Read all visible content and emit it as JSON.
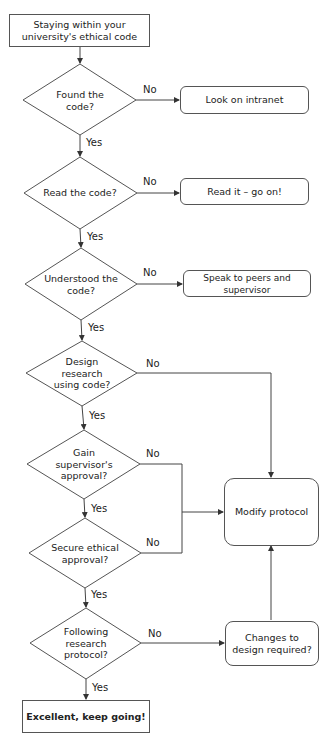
{
  "start": "Staying within your university's ethical code",
  "decisions": [
    {
      "text": "Found the code?",
      "yes": "Yes",
      "no": "No"
    },
    {
      "text": "Read the code?",
      "yes": "Yes",
      "no": "No"
    },
    {
      "text": "Understood the code?",
      "yes": "Yes",
      "no": "No"
    },
    {
      "text": "Design research using code?",
      "yes": "Yes",
      "no": "No"
    },
    {
      "text": "Gain supervisor's approval?",
      "yes": "Yes",
      "no": "No"
    },
    {
      "text": "Secure ethical approval?",
      "yes": "Yes",
      "no": "No"
    },
    {
      "text": "Following research protocol?",
      "yes": "Yes",
      "no": "No"
    }
  ],
  "actions": {
    "look_intranet": "Look on intranet",
    "read_it": "Read it –  go on!",
    "speak_peers": "Speak to peers and supervisor",
    "modify_protocol": "Modify protocol",
    "changes_design": "Changes to design required?"
  },
  "end": "Excellent, keep going!",
  "colors": {
    "line": "#444444",
    "border": "#555555",
    "background": "#ffffff"
  }
}
